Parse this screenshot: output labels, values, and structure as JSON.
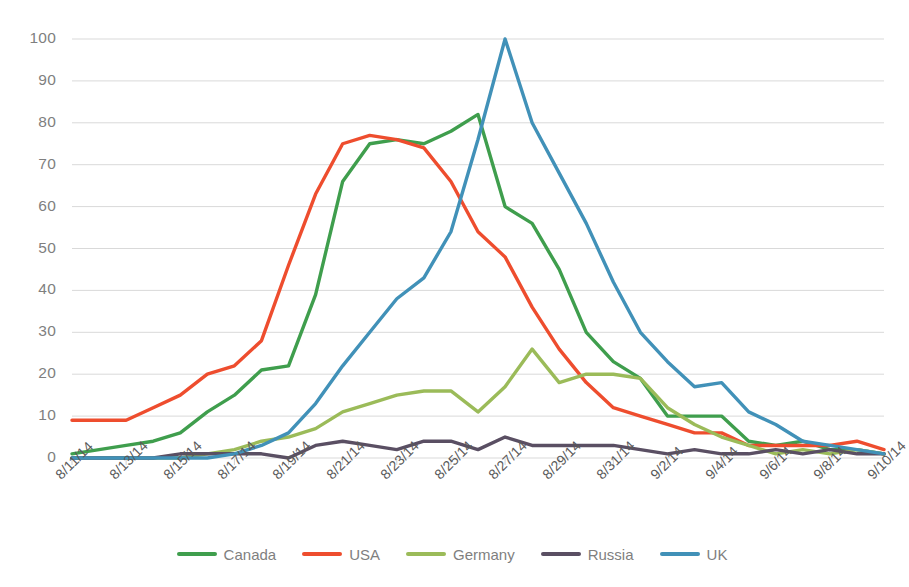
{
  "chart_data": {
    "type": "line",
    "title": "",
    "subtitle": "",
    "xlabel": "",
    "ylabel": "",
    "ylim": [
      0,
      100
    ],
    "ytick_step": 10,
    "yticks": [
      0,
      10,
      20,
      30,
      40,
      50,
      60,
      70,
      80,
      90,
      100
    ],
    "grid": true,
    "legend_position": "bottom",
    "x": [
      "8/11/14",
      "8/12/14",
      "8/13/14",
      "8/14/14",
      "8/15/14",
      "8/16/14",
      "8/17/14",
      "8/18/14",
      "8/19/14",
      "8/20/14",
      "8/21/14",
      "8/22/14",
      "8/23/14",
      "8/24/14",
      "8/25/14",
      "8/26/14",
      "8/27/14",
      "8/28/14",
      "8/29/14",
      "8/30/14",
      "8/31/14",
      "9/1/14",
      "9/2/14",
      "9/3/14",
      "9/4/14",
      "9/5/14",
      "9/6/14",
      "9/7/14",
      "9/8/14",
      "9/9/14",
      "9/10/14"
    ],
    "xtick_labels": [
      "8/11/14",
      "8/13/14",
      "8/15/14",
      "8/17/14",
      "8/19/14",
      "8/21/14",
      "8/23/14",
      "8/25/14",
      "8/27/14",
      "8/29/14",
      "8/31/14",
      "9/2/14",
      "9/4/14",
      "9/6/14",
      "9/8/14",
      "9/10/14"
    ],
    "series": [
      {
        "name": "Canada",
        "color": "#3f9e4d",
        "values": [
          1,
          2,
          3,
          4,
          6,
          11,
          15,
          21,
          22,
          39,
          66,
          75,
          76,
          75,
          78,
          82,
          60,
          56,
          45,
          30,
          23,
          19,
          10,
          10,
          10,
          4,
          3,
          4,
          2,
          2,
          1
        ]
      },
      {
        "name": "USA",
        "color": "#ee4d2e",
        "values": [
          9,
          9,
          9,
          12,
          15,
          20,
          22,
          28,
          46,
          63,
          75,
          77,
          76,
          74,
          66,
          54,
          48,
          36,
          26,
          18,
          12,
          10,
          8,
          6,
          6,
          3,
          3,
          3,
          3,
          4,
          2
        ]
      },
      {
        "name": "Germany",
        "color": "#9bbb59",
        "values": [
          0,
          0,
          0,
          0,
          0,
          1,
          2,
          4,
          5,
          7,
          11,
          13,
          15,
          16,
          16,
          11,
          17,
          26,
          18,
          20,
          20,
          19,
          12,
          8,
          5,
          3,
          1,
          2,
          1,
          2,
          1
        ]
      },
      {
        "name": "Russia",
        "color": "#5a4f63",
        "values": [
          0,
          0,
          0,
          0,
          1,
          1,
          1,
          1,
          0,
          3,
          4,
          3,
          2,
          4,
          4,
          2,
          5,
          3,
          3,
          3,
          3,
          2,
          1,
          2,
          1,
          1,
          2,
          1,
          2,
          1,
          1
        ]
      },
      {
        "name": "UK",
        "color": "#4191b8",
        "values": [
          0,
          0,
          0,
          0,
          0,
          0,
          1,
          3,
          6,
          13,
          22,
          30,
          38,
          43,
          54,
          76,
          100,
          80,
          68,
          56,
          42,
          30,
          23,
          17,
          18,
          11,
          8,
          4,
          3,
          2,
          1
        ]
      }
    ]
  }
}
